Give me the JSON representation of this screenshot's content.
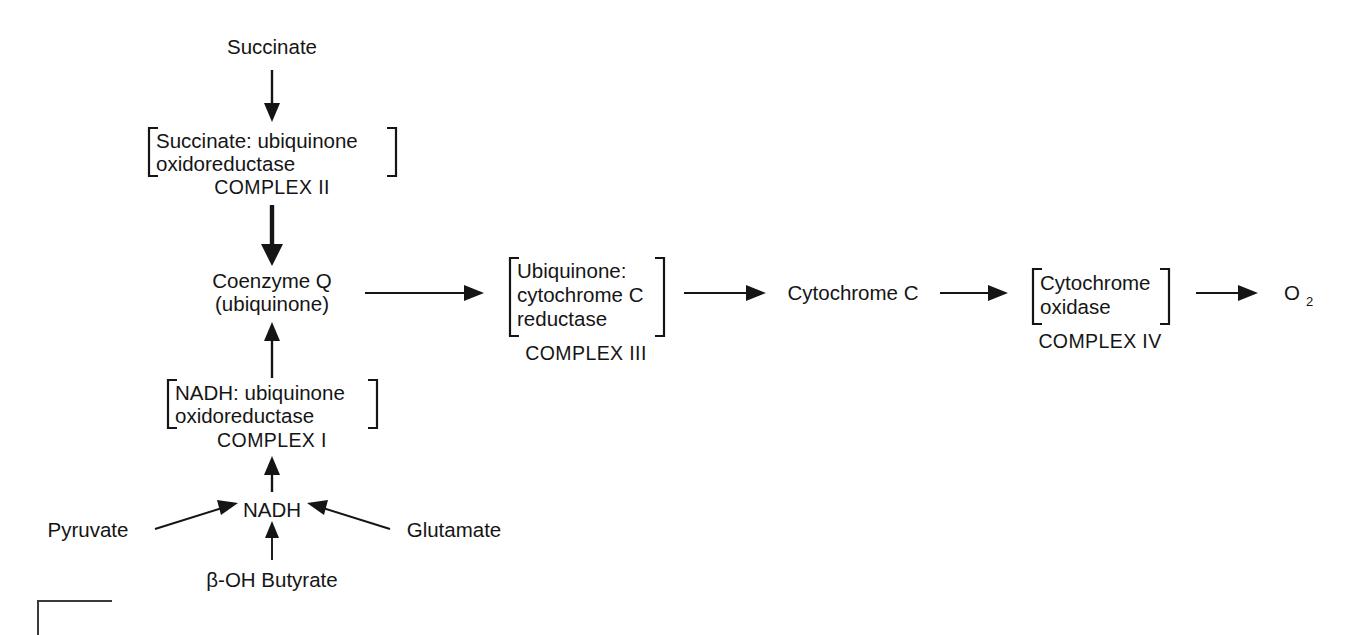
{
  "diagram": {
    "background_color": "#ffffff",
    "ink_color": "#151515",
    "nodes": {
      "succinate": "Succinate",
      "coenzyme_q_line1": "Coenzyme Q",
      "coenzyme_q_line2": "(ubiquinone)",
      "cytochrome_c": "Cytochrome C",
      "oxygen_base": "O",
      "oxygen_subscript": "2",
      "nadh": "NADH",
      "pyruvate": "Pyruvate",
      "glutamate": "Glutamate",
      "boh_butyrate": "β-OH Butyrate"
    },
    "complexes": [
      {
        "id": "complex-2",
        "enzyme_lines": [
          "Succinate: ubiquinone",
          "oxidoreductase"
        ],
        "label": "COMPLEX II"
      },
      {
        "id": "complex-1",
        "enzyme_lines": [
          "NADH: ubiquinone",
          "oxidoreductase"
        ],
        "label": "COMPLEX I"
      },
      {
        "id": "complex-3",
        "enzyme_lines": [
          "Ubiquinone:",
          "cytochrome C",
          "reductase"
        ],
        "label": "COMPLEX III"
      },
      {
        "id": "complex-4",
        "enzyme_lines": [
          "Cytochrome",
          "oxidase"
        ],
        "label": "COMPLEX IV"
      }
    ],
    "arrows": [
      {
        "id": "succinate-to-complex2",
        "direction": "down"
      },
      {
        "id": "complex2-to-coq",
        "direction": "down"
      },
      {
        "id": "coq-to-complex3",
        "direction": "right"
      },
      {
        "id": "complex3-to-cytc",
        "direction": "right"
      },
      {
        "id": "cytc-to-complex4",
        "direction": "right"
      },
      {
        "id": "complex4-to-o2",
        "direction": "right"
      },
      {
        "id": "complex1-to-coq",
        "direction": "up"
      },
      {
        "id": "nadh-to-complex1",
        "direction": "up"
      },
      {
        "id": "pyruvate-to-nadh",
        "direction": "diagonal-up-right"
      },
      {
        "id": "glutamate-to-nadh",
        "direction": "diagonal-up-left"
      },
      {
        "id": "boh-butyrate-to-nadh",
        "direction": "up"
      }
    ]
  }
}
